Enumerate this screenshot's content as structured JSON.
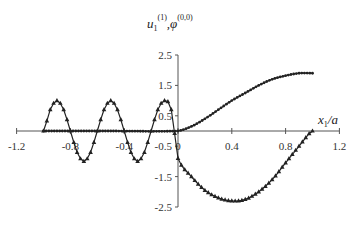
{
  "chart_data": {
    "type": "line",
    "title": "",
    "ylabel": "u1^(1), φ^(0,0)",
    "ylabel_parts": {
      "main1": "u",
      "sub1": "1",
      "sup1": "(1)",
      "sep": ",",
      "main2": "φ",
      "sup2": "(0,0)"
    },
    "xlabel": "x1/a",
    "xlabel_parts": {
      "main": "x",
      "sub": "1",
      "rest": "/a"
    },
    "xlim": [
      -1.2,
      1.2
    ],
    "ylim": [
      -2.5,
      2.5
    ],
    "x_ticks": [
      -1.2,
      -0.8,
      -0.4,
      0,
      0.4,
      0.8,
      1.2
    ],
    "x_tick_labels": [
      "-1.2",
      "-0.8",
      "-0.4",
      "0",
      "0.4",
      "0.8",
      "1.2"
    ],
    "y_ticks": [
      2.5,
      1.5,
      0.5,
      -0.5,
      -1.5,
      -2.5
    ],
    "y_tick_labels": [
      "2.5",
      "1.5",
      "0.5",
      "-0.5",
      "-1.5",
      "-2.5"
    ],
    "grid": false,
    "legend": "none",
    "series": [
      {
        "name": "φ^(0,0)",
        "marker": "triangle",
        "color": "#222222",
        "x": [
          -1.0,
          -0.95,
          -0.9,
          -0.85,
          -0.8,
          -0.75,
          -0.7,
          -0.65,
          -0.6,
          -0.55,
          -0.5,
          -0.45,
          -0.4,
          -0.35,
          -0.3,
          -0.25,
          -0.2,
          -0.15,
          -0.1,
          -0.05,
          0.0,
          0.1,
          0.2,
          0.3,
          0.4,
          0.5,
          0.6,
          0.7,
          0.8,
          0.9,
          1.0
        ],
        "values": [
          0.0,
          0.7,
          1.0,
          0.7,
          0.0,
          -0.7,
          -1.0,
          -0.7,
          0.0,
          0.7,
          1.0,
          0.7,
          0.0,
          -0.7,
          -1.0,
          -0.7,
          0.0,
          0.7,
          1.0,
          0.7,
          -0.9,
          -1.5,
          -1.95,
          -2.2,
          -2.3,
          -2.25,
          -2.0,
          -1.6,
          -1.05,
          -0.5,
          0.0
        ]
      },
      {
        "name": "u1^(1)",
        "marker": "dot",
        "color": "#222222",
        "x": [
          -1.0,
          -0.5,
          0.0,
          0.1,
          0.2,
          0.3,
          0.4,
          0.5,
          0.6,
          0.7,
          0.8,
          0.9,
          1.0
        ],
        "values": [
          0.0,
          0.0,
          0.0,
          0.15,
          0.4,
          0.7,
          1.0,
          1.25,
          1.5,
          1.7,
          1.82,
          1.9,
          1.9
        ]
      }
    ]
  }
}
